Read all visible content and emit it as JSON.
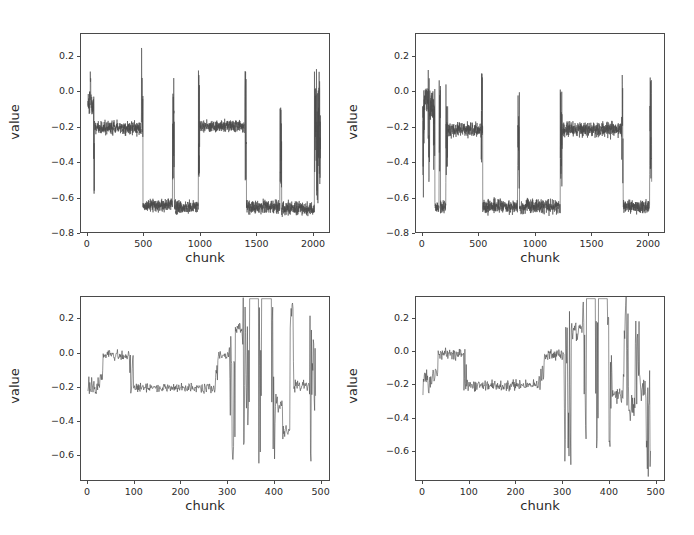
{
  "figure": {
    "title": "",
    "background": "#ffffff",
    "line_color": "#4a4a4a",
    "axis_color": "#4a4a4a",
    "panel_count": 4,
    "layout": "2x2 grid of line plots"
  },
  "chart_data": [
    {
      "id": "panel-top-left",
      "type": "line",
      "title": "",
      "xlabel": "chunk",
      "ylabel": "value",
      "xlim": [
        -60,
        2150
      ],
      "ylim": [
        -0.8,
        0.33
      ],
      "xticks": [
        0,
        500,
        1000,
        1500,
        2000
      ],
      "xticklabels": [
        "0",
        "500",
        "1000",
        "1500",
        "2000"
      ],
      "yticks": [
        0.2,
        0.0,
        -0.2,
        -0.4,
        -0.6,
        -0.8
      ],
      "yticklabels": [
        "0.2",
        "0.0",
        "-0.2",
        "-0.4",
        "-0.6",
        "-0.8"
      ],
      "grid": false,
      "legend": null,
      "series": [
        {
          "name": "value",
          "color": "#4a4a4a",
          "noise_amplitude": 0.055,
          "n_points": 2090,
          "segments": [
            {
              "x0": 0,
              "x1": 18,
              "level": -0.06,
              "noise": 0.09,
              "kind": "noisy"
            },
            {
              "x0": 18,
              "x1": 30,
              "level": 0.05,
              "noise": 0.14,
              "kind": "spike-band"
            },
            {
              "x0": 30,
              "x1": 52,
              "level": -0.08,
              "noise": 0.11,
              "kind": "noisy"
            },
            {
              "x0": 52,
              "x1": 62,
              "level": -0.3,
              "noise": 0.34,
              "kind": "transition"
            },
            {
              "x0": 62,
              "x1": 478,
              "level": -0.205,
              "noise": 0.055,
              "kind": "noisy"
            },
            {
              "x0": 478,
              "x1": 492,
              "level": 0.0,
              "noise": 0.33,
              "kind": "transition"
            },
            {
              "x0": 492,
              "x1": 755,
              "level": -0.645,
              "noise": 0.055,
              "kind": "noisy"
            },
            {
              "x0": 755,
              "x1": 772,
              "level": -0.2,
              "noise": 0.3,
              "kind": "transition"
            },
            {
              "x0": 772,
              "x1": 985,
              "level": -0.655,
              "noise": 0.055,
              "kind": "noisy"
            },
            {
              "x0": 985,
              "x1": 998,
              "level": -0.18,
              "noise": 0.33,
              "kind": "transition"
            },
            {
              "x0": 998,
              "x1": 1400,
              "level": -0.195,
              "noise": 0.05,
              "kind": "noisy"
            },
            {
              "x0": 1400,
              "x1": 1414,
              "level": -0.2,
              "noise": 0.34,
              "kind": "transition"
            },
            {
              "x0": 1414,
              "x1": 1712,
              "level": -0.655,
              "noise": 0.055,
              "kind": "noisy"
            },
            {
              "x0": 1712,
              "x1": 1728,
              "level": -0.3,
              "noise": 0.26,
              "kind": "transition"
            },
            {
              "x0": 1728,
              "x1": 2020,
              "level": -0.665,
              "noise": 0.055,
              "kind": "noisy"
            },
            {
              "x0": 2020,
              "x1": 2040,
              "level": -0.16,
              "noise": 0.33,
              "kind": "transition"
            },
            {
              "x0": 2040,
              "x1": 2055,
              "level": -0.3,
              "noise": 0.34,
              "kind": "transition"
            },
            {
              "x0": 2055,
              "x1": 2075,
              "level": -0.2,
              "noise": 0.34,
              "kind": "transition"
            }
          ]
        }
      ]
    },
    {
      "id": "panel-top-right",
      "type": "line",
      "title": "",
      "xlabel": "chunk",
      "ylabel": "value",
      "xlim": [
        -60,
        2150
      ],
      "ylim": [
        -0.8,
        0.33
      ],
      "xticks": [
        0,
        500,
        1000,
        1500,
        2000
      ],
      "xticklabels": [
        "0",
        "500",
        "1000",
        "1500",
        "2000"
      ],
      "yticks": [
        0.2,
        0.0,
        -0.2,
        -0.4,
        -0.6,
        -0.8
      ],
      "yticklabels": [
        "0.2",
        "0.0",
        "-0.2",
        "-0.4",
        "-0.6",
        "-0.8"
      ],
      "grid": false,
      "legend": null,
      "series": [
        {
          "name": "value",
          "color": "#4a4a4a",
          "noise_amplitude": 0.055,
          "n_points": 2070,
          "segments": [
            {
              "x0": 0,
              "x1": 14,
              "level": -0.33,
              "noise": 0.34,
              "kind": "transition"
            },
            {
              "x0": 14,
              "x1": 48,
              "level": -0.04,
              "noise": 0.1,
              "kind": "noisy"
            },
            {
              "x0": 48,
              "x1": 62,
              "level": -0.2,
              "noise": 0.34,
              "kind": "transition"
            },
            {
              "x0": 62,
              "x1": 95,
              "level": -0.08,
              "noise": 0.14,
              "kind": "noisy"
            },
            {
              "x0": 95,
              "x1": 108,
              "level": -0.25,
              "noise": 0.32,
              "kind": "transition"
            },
            {
              "x0": 108,
              "x1": 145,
              "level": -0.655,
              "noise": 0.055,
              "kind": "noisy"
            },
            {
              "x0": 145,
              "x1": 158,
              "level": -0.2,
              "noise": 0.34,
              "kind": "transition"
            },
            {
              "x0": 158,
              "x1": 205,
              "level": -0.655,
              "noise": 0.06,
              "kind": "noisy"
            },
            {
              "x0": 205,
              "x1": 222,
              "level": -0.22,
              "noise": 0.3,
              "kind": "transition"
            },
            {
              "x0": 222,
              "x1": 520,
              "level": -0.215,
              "noise": 0.06,
              "kind": "noisy"
            },
            {
              "x0": 520,
              "x1": 535,
              "level": -0.18,
              "noise": 0.32,
              "kind": "transition"
            },
            {
              "x0": 535,
              "x1": 845,
              "level": -0.655,
              "noise": 0.06,
              "kind": "noisy"
            },
            {
              "x0": 845,
              "x1": 862,
              "level": -0.28,
              "noise": 0.29,
              "kind": "transition"
            },
            {
              "x0": 862,
              "x1": 1225,
              "level": -0.655,
              "noise": 0.06,
              "kind": "noisy"
            },
            {
              "x0": 1225,
              "x1": 1242,
              "level": -0.26,
              "noise": 0.3,
              "kind": "transition"
            },
            {
              "x0": 1242,
              "x1": 1770,
              "level": -0.215,
              "noise": 0.06,
              "kind": "noisy"
            },
            {
              "x0": 1770,
              "x1": 1786,
              "level": -0.22,
              "noise": 0.33,
              "kind": "transition"
            },
            {
              "x0": 1786,
              "x1": 2022,
              "level": -0.655,
              "noise": 0.055,
              "kind": "noisy"
            },
            {
              "x0": 2022,
              "x1": 2040,
              "level": -0.22,
              "noise": 0.31,
              "kind": "transition"
            }
          ]
        }
      ]
    },
    {
      "id": "panel-bottom-left",
      "type": "line",
      "title": "",
      "xlabel": "chunk",
      "ylabel": "value",
      "xlim": [
        -15,
        520
      ],
      "ylim": [
        -0.75,
        0.33
      ],
      "xticks": [
        0,
        100,
        200,
        300,
        400,
        500
      ],
      "xticklabels": [
        "0",
        "100",
        "200",
        "300",
        "400",
        "500"
      ],
      "yticks": [
        0.2,
        0.0,
        -0.2,
        -0.4,
        -0.6
      ],
      "yticklabels": [
        "0.2",
        "0.0",
        "-0.2",
        "-0.4",
        "-0.6"
      ],
      "grid": false,
      "legend": null,
      "series": [
        {
          "name": "value",
          "color": "#4a4a4a",
          "noise_amplitude": 0.045,
          "n_points": 495,
          "segments": [
            {
              "x0": 0,
              "x1": 22,
              "level": -0.2,
              "noise": 0.1,
              "kind": "noisy"
            },
            {
              "x0": 22,
              "x1": 32,
              "level": -0.13,
              "noise": 0.08,
              "kind": "ramp"
            },
            {
              "x0": 32,
              "x1": 90,
              "level": -0.015,
              "noise": 0.045,
              "kind": "noisy"
            },
            {
              "x0": 90,
              "x1": 98,
              "level": -0.13,
              "noise": 0.14,
              "kind": "transition"
            },
            {
              "x0": 98,
              "x1": 272,
              "level": -0.205,
              "noise": 0.045,
              "kind": "noisy"
            },
            {
              "x0": 272,
              "x1": 280,
              "level": -0.1,
              "noise": 0.12,
              "kind": "ramp"
            },
            {
              "x0": 280,
              "x1": 305,
              "level": -0.02,
              "noise": 0.05,
              "kind": "noisy"
            },
            {
              "x0": 305,
              "x1": 318,
              "level": -0.2,
              "noise": 0.5,
              "kind": "deep-spike"
            },
            {
              "x0": 318,
              "x1": 332,
              "level": 0.15,
              "noise": 0.07,
              "kind": "high-noisy"
            },
            {
              "x0": 332,
              "x1": 348,
              "level": -0.15,
              "noise": 0.48,
              "kind": "deep-spike"
            },
            {
              "x0": 348,
              "x1": 368,
              "level": 0.32,
              "noise": 0.0,
              "kind": "clipped-high"
            },
            {
              "x0": 368,
              "x1": 374,
              "level": -0.18,
              "noise": 0.5,
              "kind": "deep-spike"
            },
            {
              "x0": 374,
              "x1": 396,
              "level": 0.32,
              "noise": 0.0,
              "kind": "clipped-high"
            },
            {
              "x0": 396,
              "x1": 404,
              "level": -0.2,
              "noise": 0.5,
              "kind": "deep-spike"
            },
            {
              "x0": 404,
              "x1": 420,
              "level": -0.3,
              "noise": 0.08,
              "kind": "noisy"
            },
            {
              "x0": 420,
              "x1": 436,
              "level": -0.46,
              "noise": 0.07,
              "kind": "noisy"
            },
            {
              "x0": 436,
              "x1": 444,
              "level": 0.05,
              "noise": 0.26,
              "kind": "spike"
            },
            {
              "x0": 444,
              "x1": 478,
              "level": -0.19,
              "noise": 0.055,
              "kind": "noisy"
            },
            {
              "x0": 478,
              "x1": 492,
              "level": -0.2,
              "noise": 0.46,
              "kind": "deep-spike"
            }
          ]
        }
      ]
    },
    {
      "id": "panel-bottom-right",
      "type": "line",
      "title": "",
      "xlabel": "chunk",
      "ylabel": "value",
      "xlim": [
        -15,
        520
      ],
      "ylim": [
        -0.78,
        0.33
      ],
      "xticks": [
        0,
        100,
        200,
        300,
        400,
        500
      ],
      "xticklabels": [
        "0",
        "100",
        "200",
        "300",
        "400",
        "500"
      ],
      "yticks": [
        0.2,
        0.0,
        -0.2,
        -0.4,
        -0.6
      ],
      "yticklabels": [
        "0.2",
        "0.0",
        "-0.2",
        "-0.4",
        "-0.6"
      ],
      "grid": false,
      "legend": null,
      "series": [
        {
          "name": "value",
          "color": "#4a4a4a",
          "noise_amplitude": 0.05,
          "n_points": 495,
          "segments": [
            {
              "x0": 0,
              "x1": 20,
              "level": -0.17,
              "noise": 0.11,
              "kind": "noisy"
            },
            {
              "x0": 20,
              "x1": 32,
              "level": -0.1,
              "noise": 0.1,
              "kind": "ramp"
            },
            {
              "x0": 32,
              "x1": 88,
              "level": -0.015,
              "noise": 0.055,
              "kind": "noisy"
            },
            {
              "x0": 88,
              "x1": 96,
              "level": -0.14,
              "noise": 0.16,
              "kind": "transition"
            },
            {
              "x0": 96,
              "x1": 250,
              "level": -0.205,
              "noise": 0.05,
              "kind": "noisy"
            },
            {
              "x0": 250,
              "x1": 262,
              "level": -0.1,
              "noise": 0.12,
              "kind": "ramp"
            },
            {
              "x0": 262,
              "x1": 305,
              "level": -0.02,
              "noise": 0.05,
              "kind": "noisy"
            },
            {
              "x0": 305,
              "x1": 320,
              "level": -0.22,
              "noise": 0.52,
              "kind": "deep-spike"
            },
            {
              "x0": 320,
              "x1": 344,
              "level": 0.12,
              "noise": 0.1,
              "kind": "high-noisy"
            },
            {
              "x0": 344,
              "x1": 352,
              "level": -0.15,
              "noise": 0.48,
              "kind": "deep-spike"
            },
            {
              "x0": 352,
              "x1": 372,
              "level": 0.32,
              "noise": 0.0,
              "kind": "clipped-high"
            },
            {
              "x0": 372,
              "x1": 378,
              "level": -0.18,
              "noise": 0.5,
              "kind": "deep-spike"
            },
            {
              "x0": 378,
              "x1": 398,
              "level": 0.32,
              "noise": 0.0,
              "kind": "clipped-high"
            },
            {
              "x0": 398,
              "x1": 408,
              "level": -0.18,
              "noise": 0.5,
              "kind": "deep-spike"
            },
            {
              "x0": 408,
              "x1": 432,
              "level": -0.28,
              "noise": 0.09,
              "kind": "noisy"
            },
            {
              "x0": 432,
              "x1": 444,
              "level": 0.0,
              "noise": 0.34,
              "kind": "spike"
            },
            {
              "x0": 444,
              "x1": 458,
              "level": -0.32,
              "noise": 0.14,
              "kind": "noisy"
            },
            {
              "x0": 458,
              "x1": 468,
              "level": -0.05,
              "noise": 0.32,
              "kind": "spike"
            },
            {
              "x0": 468,
              "x1": 480,
              "level": -0.22,
              "noise": 0.12,
              "kind": "noisy"
            },
            {
              "x0": 480,
              "x1": 492,
              "level": -0.45,
              "noise": 0.35,
              "kind": "deep-spike"
            }
          ]
        }
      ]
    }
  ]
}
